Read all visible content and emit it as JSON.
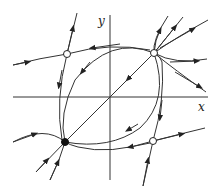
{
  "diagram": {
    "type": "phase-portrait",
    "axes": {
      "x_label": "x",
      "y_label": "y"
    },
    "equilibria": [
      {
        "name": "unstable-node",
        "position": "top-right",
        "marker": "open-circle"
      },
      {
        "name": "saddle-top-left",
        "position": "top-left",
        "marker": "open-circle"
      },
      {
        "name": "saddle-bottom-right",
        "position": "bottom-right",
        "marker": "open-circle"
      },
      {
        "name": "stable-node",
        "position": "bottom-left",
        "marker": "filled-circle"
      }
    ],
    "colors": {
      "stroke": "#222222",
      "background": "#ffffff"
    }
  }
}
